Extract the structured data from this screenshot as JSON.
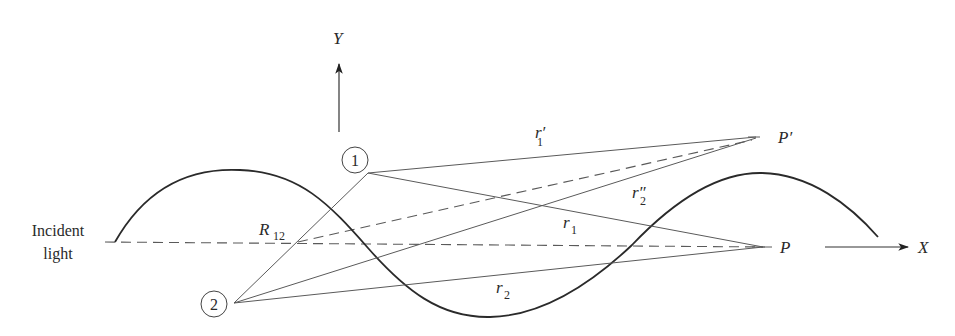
{
  "figure": {
    "axes": {
      "y_label": "Y",
      "x_label": "X"
    },
    "incident_label_line1": "Incident",
    "incident_label_line2": "light",
    "points": {
      "scatterer_1": "1",
      "scatterer_2": "2",
      "observation_P": "P",
      "observation_P_prime": "P′"
    },
    "distances": {
      "R12": {
        "main": "R",
        "sub": "12"
      },
      "r1": {
        "main": "r",
        "sub": "1"
      },
      "r1_prime": {
        "main": "r′",
        "sub": "1"
      },
      "r2": {
        "main": "r",
        "sub": "2"
      },
      "r2_double_prime": {
        "main": "r″",
        "sub": "2"
      }
    },
    "colors": {
      "ink": "#2a2a2a",
      "line": "#5a5a5a",
      "background": "#ffffff"
    }
  }
}
